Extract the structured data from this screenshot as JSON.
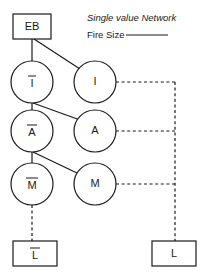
{
  "diagram": {
    "title": "Single value Network",
    "legend": {
      "label": "Fire Size",
      "line_style": "solid",
      "color": "#1a1a1a"
    },
    "colors": {
      "stroke": "#1a1a1a",
      "fill": "#ffffff",
      "background": "#ffffff"
    },
    "boxes": [
      {
        "id": "eb",
        "label": "EB",
        "overbar": false,
        "x": 13,
        "y": 14,
        "w": 38,
        "h": 25
      },
      {
        "id": "l-neg",
        "label": "L",
        "overbar": true,
        "x": 13,
        "y": 241,
        "w": 44,
        "h": 25
      },
      {
        "id": "l-pos",
        "label": "L",
        "overbar": false,
        "x": 152,
        "y": 241,
        "w": 44,
        "h": 25
      }
    ],
    "nodes": [
      {
        "id": "i-neg",
        "label": "I",
        "overbar": true,
        "cx": 32,
        "cy": 82,
        "r": 21
      },
      {
        "id": "i-pos",
        "label": "I",
        "overbar": false,
        "cx": 95,
        "cy": 82,
        "r": 21
      },
      {
        "id": "a-neg",
        "label": "A",
        "overbar": true,
        "cx": 32,
        "cy": 131,
        "r": 21
      },
      {
        "id": "a-pos",
        "label": "A",
        "overbar": false,
        "cx": 95,
        "cy": 131,
        "r": 21
      },
      {
        "id": "m-neg",
        "label": "M",
        "overbar": true,
        "cx": 32,
        "cy": 184,
        "r": 21
      },
      {
        "id": "m-pos",
        "label": "M",
        "overbar": false,
        "cx": 95,
        "cy": 184,
        "r": 21
      }
    ],
    "edges": [
      {
        "id": "eb-to-i-neg",
        "from": "eb",
        "to": "i-neg",
        "style": "solid"
      },
      {
        "id": "eb-to-i-pos",
        "from": "eb",
        "to": "i-pos",
        "style": "solid"
      },
      {
        "id": "i-neg-to-a-neg",
        "from": "i-neg",
        "to": "a-neg",
        "style": "solid"
      },
      {
        "id": "i-neg-to-a-pos",
        "from": "i-neg",
        "to": "a-pos",
        "style": "solid"
      },
      {
        "id": "a-neg-to-m-neg",
        "from": "a-neg",
        "to": "m-neg",
        "style": "solid"
      },
      {
        "id": "a-neg-to-m-pos",
        "from": "a-neg",
        "to": "m-pos",
        "style": "solid"
      },
      {
        "id": "m-neg-to-l-neg",
        "from": "m-neg",
        "to": "l-neg",
        "style": "dashed"
      },
      {
        "id": "i-pos-to-bus",
        "from": "i-pos",
        "to": "bus",
        "style": "dashed"
      },
      {
        "id": "a-pos-to-bus",
        "from": "a-pos",
        "to": "bus",
        "style": "dashed"
      },
      {
        "id": "m-pos-to-bus",
        "from": "m-pos",
        "to": "bus",
        "style": "dashed"
      },
      {
        "id": "bus-to-l-pos",
        "from": "bus",
        "to": "l-pos",
        "style": "dashed"
      }
    ]
  }
}
